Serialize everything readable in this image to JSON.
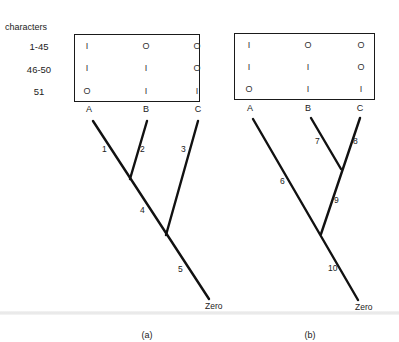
{
  "header": {
    "characters_label": "characters"
  },
  "character_rows": [
    "1-45",
    "46-50",
    "51"
  ],
  "taxa": [
    "A",
    "B",
    "C"
  ],
  "panels": [
    {
      "id": "a",
      "caption": "(a)",
      "matrix": [
        [
          "I",
          "O",
          "O"
        ],
        [
          "I",
          "I",
          "O"
        ],
        [
          "O",
          "I",
          "I"
        ]
      ],
      "root_label": "Zero",
      "branches": [
        {
          "id": "1",
          "label": "1"
        },
        {
          "id": "2",
          "label": "2"
        },
        {
          "id": "3",
          "label": "3"
        },
        {
          "id": "4",
          "label": "4"
        },
        {
          "id": "5",
          "label": "5"
        }
      ],
      "topology": "((A,B),C)"
    },
    {
      "id": "b",
      "caption": "(b)",
      "matrix": [
        [
          "I",
          "O",
          "O"
        ],
        [
          "I",
          "I",
          "O"
        ],
        [
          "O",
          "I",
          "I"
        ]
      ],
      "root_label": "Zero",
      "branches": [
        {
          "id": "6",
          "label": "6"
        },
        {
          "id": "7",
          "label": "7"
        },
        {
          "id": "8",
          "label": "8"
        },
        {
          "id": "9",
          "label": "9"
        },
        {
          "id": "10",
          "label": "10"
        }
      ],
      "topology": "(A,(B,C))"
    }
  ],
  "colors": {
    "line": "#111111",
    "text": "#222222",
    "background": "#ffffff"
  }
}
